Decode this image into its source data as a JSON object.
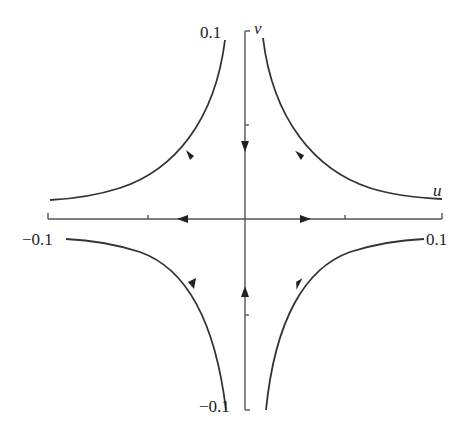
{
  "diagram": {
    "type": "phase-portrait-saddle",
    "axes": {
      "x_label": "u",
      "y_label": "v",
      "x_ticks": [
        "-0.1",
        "0.1"
      ],
      "y_ticks": [
        "0.1",
        "-0.1"
      ]
    },
    "labels": {
      "x_min": "−0.1",
      "x_max": "0.1",
      "y_max": "0.1",
      "y_min": "−0.1",
      "u_axis": "u",
      "v_axis": "v"
    },
    "trajectories": [
      {
        "quadrant": "upper-left",
        "direction": "inward-then-outward-left"
      },
      {
        "quadrant": "upper-right",
        "direction": "inward-then-outward-right"
      },
      {
        "quadrant": "lower-left",
        "direction": "inward-then-outward-left"
      },
      {
        "quadrant": "lower-right",
        "direction": "inward-then-outward-right"
      }
    ],
    "colors": {
      "line": "#333333",
      "axis": "#555555",
      "background": "#ffffff"
    }
  }
}
